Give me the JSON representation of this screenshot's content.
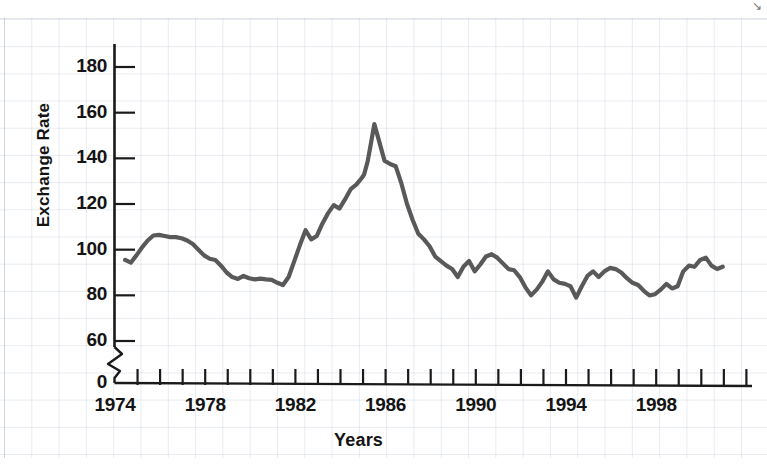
{
  "chart_data": {
    "type": "line",
    "title": "",
    "xlabel": "Years",
    "ylabel": "Exchange Rate",
    "xlim": [
      1974,
      2002
    ],
    "ylim": [
      55,
      190
    ],
    "y_axis_break": true,
    "y_break_labels": [
      "0",
      "60"
    ],
    "grid": true,
    "grid_style": "graph-paper",
    "legend": "none",
    "line_color": "#595959",
    "y_ticks": [
      0,
      60,
      80,
      100,
      120,
      140,
      160,
      180
    ],
    "y_tick_labels": [
      "0",
      "60",
      "80",
      "100",
      "120",
      "140",
      "160",
      "180"
    ],
    "x_ticks": [
      1974,
      1975,
      1976,
      1977,
      1978,
      1979,
      1980,
      1981,
      1982,
      1983,
      1984,
      1985,
      1986,
      1987,
      1988,
      1989,
      1990,
      1991,
      1992,
      1993,
      1994,
      1995,
      1996,
      1997,
      1998,
      1999,
      2000,
      2001,
      2002
    ],
    "x_tick_labels": [
      "1974",
      "1978",
      "1982",
      "1986",
      "1990",
      "1994",
      "1998"
    ],
    "x_labeled_ticks": [
      1974,
      1978,
      1982,
      1986,
      1990,
      1994,
      1998
    ],
    "series": [
      {
        "name": "Exchange Rate",
        "x": [
          1974.45,
          1974.7,
          1974.95,
          1975.2,
          1975.45,
          1975.7,
          1975.95,
          1976.2,
          1976.45,
          1976.7,
          1976.95,
          1977.2,
          1977.45,
          1977.7,
          1977.95,
          1978.2,
          1978.45,
          1978.7,
          1978.95,
          1979.2,
          1979.45,
          1979.7,
          1979.95,
          1980.2,
          1980.45,
          1980.7,
          1980.95,
          1981.2,
          1981.45,
          1981.7,
          1981.95,
          1982.2,
          1982.45,
          1982.7,
          1982.95,
          1983.2,
          1983.45,
          1983.7,
          1983.95,
          1984.2,
          1984.45,
          1984.7,
          1984.95,
          1985.05,
          1985.2,
          1985.35,
          1985.5,
          1985.7,
          1985.95,
          1986.2,
          1986.45,
          1986.7,
          1986.95,
          1987.2,
          1987.45,
          1987.7,
          1987.95,
          1988.2,
          1988.45,
          1988.7,
          1988.95,
          1989.2,
          1989.45,
          1989.7,
          1989.95,
          1990.2,
          1990.45,
          1990.7,
          1990.95,
          1991.2,
          1991.45,
          1991.7,
          1991.95,
          1992.2,
          1992.45,
          1992.7,
          1992.95,
          1993.2,
          1993.45,
          1993.7,
          1993.95,
          1994.2,
          1994.45,
          1994.7,
          1994.95,
          1995.2,
          1995.45,
          1995.7,
          1995.95,
          1996.2,
          1996.45,
          1996.7,
          1996.95,
          1997.2,
          1997.45,
          1997.7,
          1997.95,
          1998.2,
          1998.45,
          1998.7,
          1998.95,
          1999.2,
          1999.45,
          1999.7,
          1999.95,
          2000.2,
          2000.45,
          2000.7,
          2000.95
        ],
        "y": [
          95.5,
          94.3,
          97.5,
          101.0,
          104.0,
          106.2,
          106.5,
          106.0,
          105.5,
          105.5,
          105.0,
          104.0,
          102.5,
          100.0,
          97.5,
          96.0,
          95.5,
          93.0,
          90.0,
          88.0,
          87.2,
          88.5,
          87.5,
          87.0,
          87.3,
          87.0,
          86.8,
          85.5,
          84.5,
          88.0,
          95.0,
          102.0,
          108.5,
          104.5,
          106.0,
          111.5,
          116.0,
          119.5,
          118.0,
          122.0,
          126.5,
          128.5,
          131.5,
          133.0,
          138.5,
          146.5,
          155.0,
          148.0,
          139.0,
          137.5,
          136.5,
          129.0,
          120.0,
          113.0,
          107.0,
          104.5,
          101.5,
          97.0,
          95.0,
          93.0,
          91.5,
          88.0,
          92.5,
          95.0,
          90.5,
          93.5,
          97.0,
          98.0,
          96.5,
          94.0,
          91.5,
          91.0,
          88.0,
          83.5,
          80.0,
          82.5,
          86.0,
          90.5,
          87.0,
          85.5,
          85.0,
          84.0,
          79.0,
          84.0,
          88.5,
          90.5,
          88.0,
          90.5,
          92.0,
          91.5,
          90.0,
          87.5,
          85.5,
          84.5,
          82.0,
          80.0,
          80.5,
          82.5,
          85.0,
          83.0,
          84.0,
          90.5,
          93.0,
          92.5,
          95.5,
          96.5,
          93.0,
          91.5,
          92.5
        ]
      }
    ]
  },
  "axis": {
    "y_label": "Exchange Rate",
    "x_label": "Years",
    "y_tick_labels": [
      "180",
      "160",
      "140",
      "120",
      "100",
      "80",
      "60",
      "0"
    ],
    "x_tick_labels": [
      "1974",
      "1978",
      "1982",
      "1986",
      "1990",
      "1994",
      "1998"
    ]
  },
  "marks": {
    "corner_glyph": "↘"
  }
}
